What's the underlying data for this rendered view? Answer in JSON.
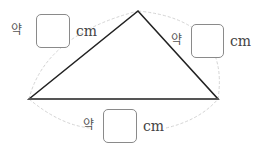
{
  "diagram": {
    "title": "",
    "shape": "triangle",
    "sides": [
      {
        "id": "left",
        "prefix": "약",
        "value": "",
        "unit": "cm"
      },
      {
        "id": "right",
        "prefix": "약",
        "value": "",
        "unit": "cm"
      },
      {
        "id": "bottom",
        "prefix": "약",
        "value": "",
        "unit": "cm"
      }
    ],
    "colors": {
      "triangle": "#222222",
      "arc": "#cfcfcf",
      "box_border": "#8a8a8a",
      "text": "#444444"
    }
  }
}
